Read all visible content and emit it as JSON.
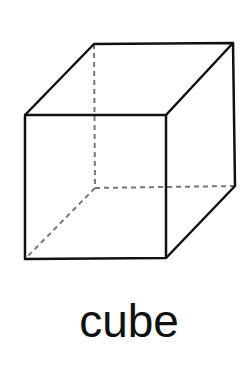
{
  "figure": {
    "shape": "cube",
    "label": "cube",
    "colors": {
      "edge": "#111111",
      "hidden_edge": "#777777",
      "background": "#ffffff"
    },
    "vertices": {
      "front_top_left": [
        25,
        115
      ],
      "front_top_right": [
        166,
        115
      ],
      "front_bottom_left": [
        25,
        259
      ],
      "front_bottom_right": [
        166,
        258
      ],
      "back_top_left": [
        94,
        44
      ],
      "back_top_right": [
        233,
        43
      ],
      "back_bottom_right": [
        235,
        186
      ],
      "back_bottom_left": [
        95,
        188
      ]
    }
  }
}
